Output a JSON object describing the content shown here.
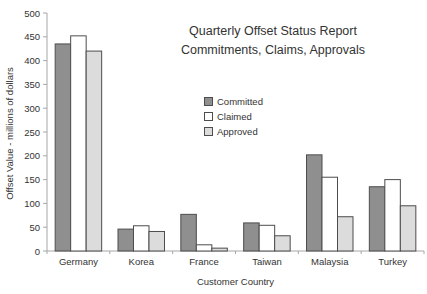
{
  "chart_data": {
    "type": "bar",
    "title": "Quarterly Offset Status Report",
    "subtitle": "Commitments, Claims, Approvals",
    "xlabel": "Customer Country",
    "ylabel": "Offset Value - millions of dollars",
    "ylim": [
      0,
      500
    ],
    "ytick_step": 50,
    "ytick_labels": [
      "0",
      "50",
      "100",
      "150",
      "200",
      "250",
      "300",
      "350",
      "400",
      "450",
      "500"
    ],
    "grid": false,
    "legend_position": "floating-center",
    "categories": [
      "Germany",
      "Korea",
      "France",
      "Taiwan",
      "Malaysia",
      "Turkey"
    ],
    "series": [
      {
        "name": "Committed",
        "color": "#8f8f8f",
        "values": [
          435,
          46,
          77,
          59,
          202,
          135
        ]
      },
      {
        "name": "Claimed",
        "color": "#ffffff",
        "values": [
          452,
          53,
          13,
          54,
          155,
          150
        ]
      },
      {
        "name": "Approved",
        "color": "#dcdcdc",
        "values": [
          420,
          41,
          6,
          32,
          72,
          95
        ]
      }
    ],
    "colors": {
      "bar_stroke": "#4d4d4d",
      "axis": "#a6a6a6",
      "text": "#333333",
      "background": "#ffffff"
    }
  }
}
